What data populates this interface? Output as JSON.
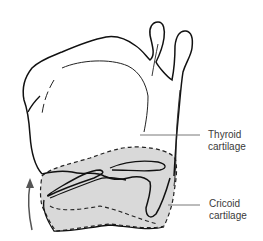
{
  "figure": {
    "labels": [
      {
        "id": "thyroid",
        "line1": "Thyroid",
        "line2": "cartilage"
      },
      {
        "id": "cricoid",
        "line1": "Cricoid",
        "line2": "cartilage"
      }
    ],
    "annotations": {
      "arrow": "upward-rotation-arrow"
    },
    "colors": {
      "outline": "#111111",
      "cricoid_fill": "#d9d9d9",
      "leader_line": "#555555",
      "arrow": "#555555",
      "text": "#3a3a3a"
    }
  }
}
